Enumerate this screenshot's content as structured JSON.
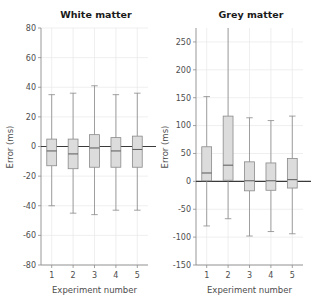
{
  "figure": {
    "width": 319,
    "height": 302,
    "background": "#ffffff",
    "grid_color": "#e8e8e8",
    "box_fill": "#dcdcdc",
    "box_edge": "#8a8a8a",
    "zero_line_color": "#3a3a3a",
    "text_color": "#4d4d4d",
    "title_color": "#1a1a1a"
  },
  "chart_data": [
    {
      "type": "box",
      "panel": "left",
      "title": "White matter",
      "xlabel": "Experiment number",
      "ylabel": "Error (ms)",
      "categories": [
        "1",
        "2",
        "3",
        "4",
        "5"
      ],
      "xtick_labels": [
        "1",
        "2",
        "3",
        "4",
        "5"
      ],
      "ytick_labels": [
        "80",
        "60",
        "40",
        "20",
        "0",
        "-20",
        "-40",
        "-60",
        "-80"
      ],
      "yticks": [
        80,
        60,
        40,
        20,
        0,
        -20,
        -40,
        -60,
        -80
      ],
      "ylim": [
        -80,
        80
      ],
      "xlim": [
        0.5,
        5.5
      ],
      "grid": true,
      "legend": "none",
      "zero_reference_line": 0,
      "boxes": [
        {
          "category": "1",
          "whisker_low": -40,
          "q1": -13,
          "median": -3,
          "q3": 5,
          "whisker_high": 35
        },
        {
          "category": "2",
          "whisker_low": -45,
          "q1": -15,
          "median": -5,
          "q3": 5,
          "whisker_high": 36
        },
        {
          "category": "3",
          "whisker_low": -46,
          "q1": -14,
          "median": -1,
          "q3": 8,
          "whisker_high": 41
        },
        {
          "category": "4",
          "whisker_low": -43,
          "q1": -14,
          "median": -3,
          "q3": 6,
          "whisker_high": 35
        },
        {
          "category": "5",
          "whisker_low": -43,
          "q1": -14,
          "median": -2,
          "q3": 7,
          "whisker_high": 36
        }
      ]
    },
    {
      "type": "box",
      "panel": "right",
      "title": "Grey matter",
      "xlabel": "Experiment number",
      "ylabel": "Error (ms)",
      "categories": [
        "1",
        "2",
        "3",
        "4",
        "5"
      ],
      "xtick_labels": [
        "1",
        "2",
        "3",
        "4",
        "5"
      ],
      "ytick_labels": [
        "250",
        "200",
        "150",
        "100",
        "50",
        "0",
        "-50",
        "-100",
        "-150"
      ],
      "yticks": [
        250,
        200,
        150,
        100,
        50,
        0,
        -50,
        -100,
        -150
      ],
      "ylim": [
        -150,
        275
      ],
      "xlim": [
        0.5,
        5.5
      ],
      "grid": true,
      "legend": "none",
      "zero_reference_line": 0,
      "boxes": [
        {
          "category": "1",
          "whisker_low": -80,
          "q1": 1,
          "median": 15,
          "q3": 62,
          "whisker_high": 152
        },
        {
          "category": "2",
          "whisker_low": -67,
          "q1": 2,
          "median": 29,
          "q3": 117,
          "whisker_high": 290
        },
        {
          "category": "3",
          "whisker_low": -98,
          "q1": -17,
          "median": 1,
          "q3": 35,
          "whisker_high": 114
        },
        {
          "category": "4",
          "whisker_low": -90,
          "q1": -16,
          "median": 1,
          "q3": 33,
          "whisker_high": 109
        },
        {
          "category": "5",
          "whisker_low": -94,
          "q1": -12,
          "median": 3,
          "q3": 41,
          "whisker_high": 117
        }
      ]
    }
  ]
}
